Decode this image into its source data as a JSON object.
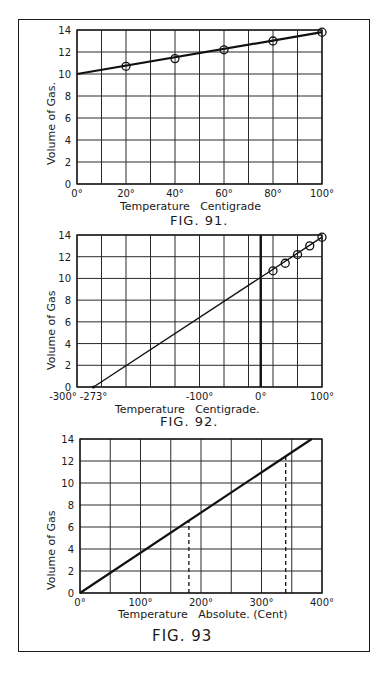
{
  "figures": [
    {
      "caption": "FIG. 91.",
      "xlabel": "Temperature   Centigrade",
      "ylabel": "Volume of Gas.",
      "x_ticks": [
        "0°",
        "20°",
        "40°",
        "60°",
        "80°",
        "100°"
      ],
      "y_ticks": [
        "0",
        "2",
        "4",
        "6",
        "8",
        "10",
        "12",
        "14"
      ]
    },
    {
      "caption": "FIG. 92.",
      "xlabel": "Temperature   Centigrade.",
      "ylabel": "Volume of Gas",
      "x_ticks": [
        "-300°",
        "-273°",
        "-100°",
        "0°",
        "100°"
      ],
      "y_ticks": [
        "0",
        "2",
        "4",
        "6",
        "8",
        "10",
        "12",
        "14"
      ]
    },
    {
      "caption": "FIG. 93",
      "xlabel": "Temperature   Absolute. (Cent)",
      "ylabel": "Volume of Gas",
      "x_ticks": [
        "0°",
        "100°",
        "200°",
        "300°",
        "400°"
      ],
      "y_ticks": [
        "0",
        "2",
        "4",
        "6",
        "8",
        "10",
        "12",
        "14"
      ]
    }
  ],
  "chart_data": [
    {
      "type": "line",
      "title": "FIG. 91.",
      "xlabel": "Temperature Centigrade",
      "ylabel": "Volume of Gas",
      "xlim": [
        0,
        100
      ],
      "ylim": [
        0,
        14
      ],
      "grid": true,
      "x_grid_step": 10,
      "y_grid_step": 2,
      "series": [
        {
          "name": "measured",
          "marker": "circle",
          "x": [
            20,
            40,
            60,
            80,
            100
          ],
          "y": [
            10.7,
            11.4,
            12.2,
            13.0,
            13.8
          ]
        },
        {
          "name": "line",
          "x": [
            0,
            100
          ],
          "y": [
            10,
            13.8
          ]
        }
      ]
    },
    {
      "type": "line",
      "title": "FIG. 92.",
      "xlabel": "Temperature Centigrade",
      "ylabel": "Volume of Gas",
      "xlim": [
        -300,
        100
      ],
      "ylim": [
        0,
        14
      ],
      "grid": true,
      "x_grid_step": 40,
      "y_grid_step": 2,
      "annotations": [
        "-273°",
        "0° (bold vertical line)"
      ],
      "series": [
        {
          "name": "measured",
          "marker": "circle",
          "x": [
            20,
            40,
            60,
            80,
            100
          ],
          "y": [
            10.7,
            11.4,
            12.2,
            13.0,
            13.8
          ]
        },
        {
          "name": "extrapolated line",
          "x": [
            -273,
            100
          ],
          "y": [
            0,
            13.8
          ]
        }
      ]
    },
    {
      "type": "line",
      "title": "FIG. 93",
      "xlabel": "Temperature Absolute (Cent)",
      "ylabel": "Volume of Gas",
      "xlim": [
        0,
        400
      ],
      "ylim": [
        0,
        14
      ],
      "grid": true,
      "x_grid_step": 50,
      "y_grid_step": 2,
      "series": [
        {
          "name": "line",
          "x": [
            0,
            383
          ],
          "y": [
            0,
            14
          ]
        },
        {
          "name": "dashed-1",
          "x": [
            180,
            180
          ],
          "y": [
            0,
            6.6
          ]
        },
        {
          "name": "dashed-2",
          "x": [
            340,
            340
          ],
          "y": [
            0,
            12.4
          ]
        }
      ]
    }
  ]
}
